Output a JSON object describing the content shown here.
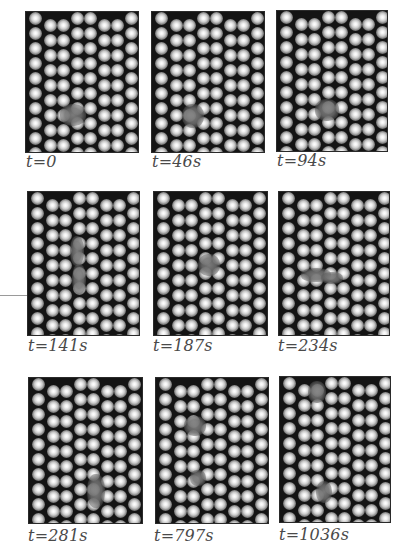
{
  "figure": {
    "panels": [
      {
        "label": "t=0",
        "defects": [
          {
            "x": 34,
            "y": 92,
            "w": 26,
            "h": 22
          }
        ]
      },
      {
        "label": "t=46s",
        "defects": [
          {
            "x": 30,
            "y": 92,
            "w": 22,
            "h": 24
          }
        ]
      },
      {
        "label": "t=94s",
        "defects": [
          {
            "x": 38,
            "y": 88,
            "w": 24,
            "h": 22
          }
        ]
      },
      {
        "label": "t=141s",
        "defects": [
          {
            "x": 42,
            "y": 44,
            "w": 14,
            "h": 30
          },
          {
            "x": 44,
            "y": 72,
            "w": 14,
            "h": 30
          }
        ]
      },
      {
        "label": "t=187s",
        "defects": [
          {
            "x": 44,
            "y": 62,
            "w": 22,
            "h": 22
          }
        ]
      },
      {
        "label": "t=234s",
        "defects": [
          {
            "x": 22,
            "y": 76,
            "w": 30,
            "h": 14
          },
          {
            "x": 42,
            "y": 80,
            "w": 22,
            "h": 12
          }
        ]
      },
      {
        "label": "t=281s",
        "defects": [
          {
            "x": 58,
            "y": 96,
            "w": 18,
            "h": 34
          }
        ]
      },
      {
        "label": "t=797s",
        "defects": [
          {
            "x": 28,
            "y": 38,
            "w": 22,
            "h": 20
          },
          {
            "x": 34,
            "y": 92,
            "w": 16,
            "h": 16
          }
        ]
      },
      {
        "label": "t=1036s",
        "defects": [
          {
            "x": 28,
            "y": 4,
            "w": 18,
            "h": 22
          },
          {
            "x": 36,
            "y": 104,
            "w": 16,
            "h": 22
          }
        ]
      }
    ]
  },
  "colors": {
    "background": "#ffffff",
    "lattice_dark": "#141414",
    "label_text": "#4a4a4a",
    "rule_line": "#9a9a9a"
  }
}
